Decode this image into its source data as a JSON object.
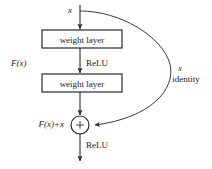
{
  "diagram": {
    "background_color": "#ffffff",
    "stroke_color": "#2a2a2a",
    "text_color": "#1a1a1a",
    "input_label": "x",
    "blocks": [
      {
        "id": "weight-layer-1",
        "label": "weight layer"
      },
      {
        "id": "weight-layer-2",
        "label": "weight layer"
      }
    ],
    "activations": [
      {
        "id": "relu-mid",
        "label": "ReLU"
      },
      {
        "id": "relu-out",
        "label": "ReLU"
      }
    ],
    "branch_label": "F(x)",
    "sum_label": "F(x)+x",
    "sum_operator": "+",
    "skip_label_symbol": "x",
    "skip_label_text": "identity"
  }
}
